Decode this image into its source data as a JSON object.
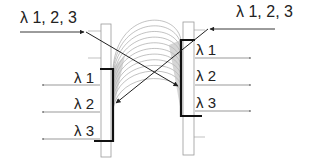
{
  "diagram": {
    "left_input_label": "λ 1, 2, 3",
    "right_input_label": "λ 1, 2, 3",
    "left_outputs": [
      "λ 1",
      "λ 2",
      "λ 3"
    ],
    "right_outputs": [
      "λ 1",
      "λ 2",
      "λ 3"
    ],
    "colors": {
      "line": "#222222",
      "thin_line": "#666666",
      "plate_stroke": "#999999",
      "fan": "#888888"
    }
  }
}
